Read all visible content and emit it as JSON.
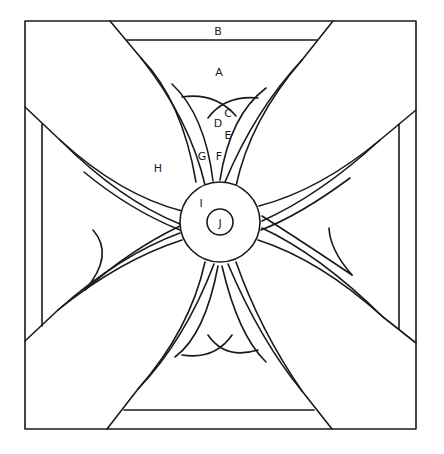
{
  "diagram": {
    "colors": {
      "line": "#1a1a1a",
      "background": "#ffffff"
    },
    "labels": [
      {
        "id": "B",
        "text": "B",
        "x": 218,
        "y": 31
      },
      {
        "id": "A",
        "text": "A",
        "x": 219,
        "y": 72
      },
      {
        "id": "C",
        "text": "C",
        "x": 228,
        "y": 113
      },
      {
        "id": "D",
        "text": "D",
        "x": 218,
        "y": 123
      },
      {
        "id": "E",
        "text": "E",
        "x": 228,
        "y": 135
      },
      {
        "id": "G",
        "text": "G",
        "x": 202,
        "y": 156
      },
      {
        "id": "F",
        "text": "F",
        "x": 219,
        "y": 156
      },
      {
        "id": "H",
        "text": "H",
        "x": 158,
        "y": 168
      },
      {
        "id": "I",
        "text": "I",
        "x": 201,
        "y": 203
      },
      {
        "id": "J",
        "text": "J",
        "x": 220,
        "y": 222
      }
    ]
  }
}
